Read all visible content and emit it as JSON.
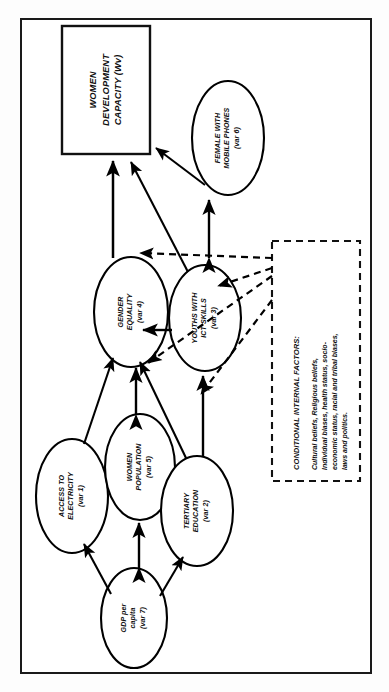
{
  "figure": {
    "orientation": "rotated-90-ccw",
    "border_color": "#1a1a1a",
    "line_color": "#000000"
  },
  "outcome_box": {
    "label": "WOMEN\nDEVELOPMENT\nCAPACITY (Wv)",
    "shape": "rectangle"
  },
  "nodes": [
    {
      "id": "var6",
      "label": "FEMALE WITH\nMOBILE PHONES\n(var 6)",
      "shape": "ellipse"
    },
    {
      "id": "var4",
      "label": "GENDER\nEQUALITY\n(var 4)",
      "shape": "ellipse"
    },
    {
      "id": "var3",
      "label": "YOUTHS WITH\nICT SKILLS\n(var 3)",
      "shape": "ellipse"
    },
    {
      "id": "var1",
      "label": "ACCESS TO\nELECTRICITY\n(var 1)",
      "shape": "ellipse"
    },
    {
      "id": "var5",
      "label": "WOMEN\nPOPULATION\n(var 5)",
      "shape": "ellipse"
    },
    {
      "id": "var2",
      "label": "TERTIARY\nEDUCATION\n(var 2)",
      "shape": "ellipse"
    },
    {
      "id": "var7",
      "label": "GDP per\ncapita\n(var 7)",
      "shape": "ellipse"
    }
  ],
  "factors_box": {
    "title": "CONDITIONAL INTERNAL FACTORS:",
    "body": "Cultural beliefs, Religious beliefs,\nIndividual biases, health status, socio-\neconomic status, racial and tribal biases,\nlaws and politics.",
    "border_style": "dashed"
  },
  "edges": [
    {
      "from": "var4",
      "to": "outcome_box",
      "style": "solid",
      "arrow": "single"
    },
    {
      "from": "var3",
      "to": "outcome_box",
      "style": "solid",
      "arrow": "single"
    },
    {
      "from": "var6",
      "to": "outcome_box",
      "style": "solid",
      "arrow": "single"
    },
    {
      "from": "var3",
      "to": "var6",
      "style": "solid",
      "arrow": "double"
    },
    {
      "from": "var3",
      "to": "var4",
      "style": "solid",
      "arrow": "single"
    },
    {
      "from": "var5",
      "to": "var4",
      "style": "solid",
      "arrow": "double"
    },
    {
      "from": "var1",
      "to": "var4",
      "style": "solid",
      "arrow": "single"
    },
    {
      "from": "var2",
      "to": "var4",
      "style": "solid",
      "arrow": "single"
    },
    {
      "from": "var2",
      "to": "var3",
      "style": "solid",
      "arrow": "single"
    },
    {
      "from": "var7",
      "to": "var1",
      "style": "solid",
      "arrow": "single"
    },
    {
      "from": "var7",
      "to": "var5",
      "style": "solid",
      "arrow": "double"
    },
    {
      "from": "var7",
      "to": "var2",
      "style": "solid",
      "arrow": "single"
    },
    {
      "from": "factors_box",
      "to": "var4",
      "style": "dashed",
      "arrow": "single"
    },
    {
      "from": "factors_box",
      "to": "var3",
      "style": "dashed",
      "arrow": "single"
    },
    {
      "from": "factors_box",
      "to": "var5",
      "style": "dashed",
      "arrow": "single"
    },
    {
      "from": "factors_box",
      "to": "var2",
      "style": "dashed",
      "arrow": "single"
    }
  ]
}
